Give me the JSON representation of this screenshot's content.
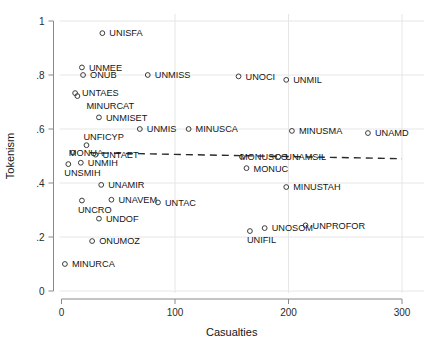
{
  "chart_data": {
    "type": "scatter",
    "title": "",
    "xlabel": "Casualties",
    "ylabel": "Tokenism",
    "xlim": [
      0,
      300
    ],
    "ylim": [
      0,
      1
    ],
    "xticks": [
      "0",
      "100",
      "200",
      "300"
    ],
    "xtick_values": [
      0,
      100,
      200,
      300
    ],
    "yticks": [
      "0",
      ".2",
      ".4",
      ".6",
      ".8",
      "1"
    ],
    "ytick_values": [
      0,
      0.2,
      0.4,
      0.6,
      0.8,
      1.0
    ],
    "grid": true,
    "legend": "none",
    "marker_style": "open-circle",
    "points": [
      {
        "label": "UNISFA",
        "x": 36,
        "y": 0.955,
        "lx": 7,
        "ly": 3.2
      },
      {
        "label": "UNMEE",
        "x": 18,
        "y": 0.828,
        "lx": 7,
        "ly": 3.2
      },
      {
        "label": "ONUB",
        "x": 19,
        "y": 0.8,
        "lx": 7,
        "ly": 3.2
      },
      {
        "label": "UNMISS",
        "x": 76,
        "y": 0.8,
        "lx": 7,
        "ly": 3.2
      },
      {
        "label": "UNOCI",
        "x": 156,
        "y": 0.795,
        "lx": 7,
        "ly": 3.2
      },
      {
        "label": "UNMIL",
        "x": 198,
        "y": 0.782,
        "lx": 7,
        "ly": 3.2
      },
      {
        "label": "UNTAES",
        "x": 12,
        "y": 0.733,
        "lx": 7,
        "ly": 3.2
      },
      {
        "label": "MINURCAT",
        "x": 14,
        "y": 0.722,
        "lx": 9,
        "ly": 12.5
      },
      {
        "label": "UNMISET",
        "x": 33,
        "y": 0.643,
        "lx": 7,
        "ly": 3.2
      },
      {
        "label": "UNMIS",
        "x": 69,
        "y": 0.6,
        "lx": 7,
        "ly": 3.2
      },
      {
        "label": "MINUSCA",
        "x": 112,
        "y": 0.6,
        "lx": 7,
        "ly": 3.2
      },
      {
        "label": "MINUSMA",
        "x": 203,
        "y": 0.593,
        "lx": 7,
        "ly": 3.2
      },
      {
        "label": "UNAMD",
        "x": 270,
        "y": 0.585,
        "lx": 7,
        "ly": 3.2
      },
      {
        "label": "UNFICYP",
        "x": 22,
        "y": 0.54,
        "lx": -3,
        "ly": -5.0
      },
      {
        "label": "MONUA",
        "x": 10,
        "y": 0.512,
        "lx": -4,
        "ly": 3.0
      },
      {
        "label": "UNTAET",
        "x": 30,
        "y": 0.505,
        "lx": 7,
        "ly": 3.4
      },
      {
        "label": "MONUSCO",
        "x": 159,
        "y": 0.497,
        "lx": -2,
        "ly": 3.4
      },
      {
        "label": "UNAMSIL",
        "x": 191,
        "y": 0.497,
        "lx": 7,
        "ly": 3.4
      },
      {
        "label": "UNMIH",
        "x": 17,
        "y": 0.475,
        "lx": 7,
        "ly": 3.4
      },
      {
        "label": "UNSMIH",
        "x": 6,
        "y": 0.47,
        "lx": -4,
        "ly": 12.0
      },
      {
        "label": "MONUC",
        "x": 163,
        "y": 0.455,
        "lx": 7,
        "ly": 3.4
      },
      {
        "label": "UNAMIR",
        "x": 35,
        "y": 0.393,
        "lx": 7,
        "ly": 3.2
      },
      {
        "label": "MINUSTAH",
        "x": 198,
        "y": 0.385,
        "lx": 7,
        "ly": 3.2
      },
      {
        "label": "UNAVEM",
        "x": 44,
        "y": 0.338,
        "lx": 7,
        "ly": 3.2
      },
      {
        "label": "UNCRO",
        "x": 18,
        "y": 0.335,
        "lx": -4,
        "ly": 12.0
      },
      {
        "label": "UNTAC",
        "x": 85,
        "y": 0.328,
        "lx": 7,
        "ly": 3.2
      },
      {
        "label": "UNDOF",
        "x": 33,
        "y": 0.268,
        "lx": 7,
        "ly": 3.2
      },
      {
        "label": "UNOSOM",
        "x": 179,
        "y": 0.233,
        "lx": 7,
        "ly": 3.2
      },
      {
        "label": "UNPROFOR",
        "x": 215,
        "y": 0.243,
        "lx": 7,
        "ly": 3.2
      },
      {
        "label": "UNIFIL",
        "x": 166,
        "y": 0.222,
        "lx": -3,
        "ly": 12.0
      },
      {
        "label": "ONUMOZ",
        "x": 27,
        "y": 0.185,
        "lx": 7,
        "ly": 3.2
      },
      {
        "label": "MINURCA",
        "x": 3,
        "y": 0.1,
        "lx": 7,
        "ly": 3.2
      }
    ],
    "fit_line": {
      "style": "dashed",
      "x_start": 25,
      "y_start": 0.512,
      "x_end": 300,
      "y_end": 0.49
    }
  }
}
